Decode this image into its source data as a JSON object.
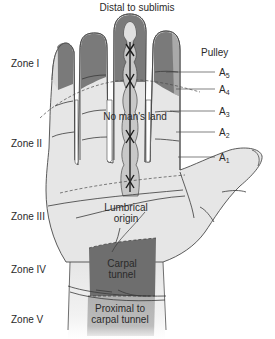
{
  "figure": {
    "type": "anatomical-diagram",
    "top_label": "Distal to sublimis",
    "zones": [
      {
        "id": "I",
        "label": "Zone I"
      },
      {
        "id": "II",
        "label": "Zone II"
      },
      {
        "id": "III",
        "label": "Zone III"
      },
      {
        "id": "IV",
        "label": "Zone IV"
      },
      {
        "id": "V",
        "label": "Zone V"
      }
    ],
    "pulley": {
      "heading": "Pulley",
      "items": [
        {
          "letter": "A",
          "sub": "5"
        },
        {
          "letter": "A",
          "sub": "4"
        },
        {
          "letter": "A",
          "sub": "3"
        },
        {
          "letter": "A",
          "sub": "2"
        },
        {
          "letter": "A",
          "sub": "1"
        }
      ]
    },
    "regions": {
      "no_mans_land": "No man's land",
      "lumbrical_line1": "Lumbrical",
      "lumbrical_line2": "origin",
      "carpal_line1": "Carpal",
      "carpal_line2": "tunnel",
      "proximal_line1": "Proximal to",
      "proximal_line2": "carpal tunnel"
    },
    "colors": {
      "skin": "#e6e6e6",
      "zone_dark": "#7a7a7a",
      "zone_light": "#dcdcdc",
      "carpal": "#6e6e6e",
      "proximal": "#b4b4b4",
      "outline": "#4a4a4a",
      "text": "#2a2a2a"
    }
  }
}
